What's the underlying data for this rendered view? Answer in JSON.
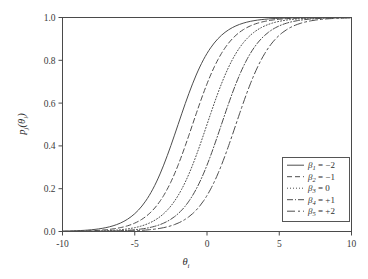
{
  "chart_data": {
    "type": "line",
    "title": "",
    "xlabel": "θᵢ",
    "ylabel": "pⱼ(θᵢ)",
    "xlim": [
      -10,
      10
    ],
    "ylim": [
      0.0,
      1.0
    ],
    "grid": false,
    "legend_position": "bottom-right",
    "x_ticks": [
      "-10",
      "-5",
      "0",
      "5",
      "10"
    ],
    "x_tick_values": [
      -10,
      -5,
      0,
      5,
      10
    ],
    "y_ticks": [
      "0.0",
      "0.2",
      "0.4",
      "0.6",
      "0.8",
      "1.0"
    ],
    "y_tick_values": [
      0.0,
      0.2,
      0.4,
      0.6,
      0.8,
      1.0
    ],
    "model": "logistic item characteristic curve",
    "discrimination": 0.8,
    "series": [
      {
        "name": "β₁ = −2",
        "beta_symbol": "β",
        "beta_index": "1",
        "beta_value": -2,
        "beta_label": "= −2",
        "linestyle": "solid",
        "dasharray": "",
        "x": [
          -10,
          -9,
          -8,
          -7,
          -6,
          -5,
          -4,
          -3,
          -2,
          -1,
          0,
          1,
          2,
          3,
          4,
          5,
          6,
          7,
          8,
          9,
          10
        ],
        "values": [
          0.0013,
          0.0029,
          0.0065,
          0.0144,
          0.0317,
          0.0687,
          0.1419,
          0.2689,
          0.4502,
          0.6457,
          0.8022,
          0.9002,
          0.9526,
          0.9781,
          0.99,
          0.9955,
          0.998,
          0.9991,
          0.9996,
          0.9998,
          0.9999
        ]
      },
      {
        "name": "β₂ = −1",
        "beta_symbol": "β",
        "beta_index": "2",
        "beta_value": -1,
        "beta_label": "= −1",
        "linestyle": "dashed",
        "dasharray": "5,3",
        "x": [
          -10,
          -9,
          -8,
          -7,
          -6,
          -5,
          -4,
          -3,
          -2,
          -1,
          0,
          1,
          2,
          3,
          4,
          5,
          6,
          7,
          8,
          9,
          10
        ],
        "values": [
          0.0006,
          0.0013,
          0.0029,
          0.0065,
          0.0144,
          0.0317,
          0.0687,
          0.1419,
          0.2689,
          0.4502,
          0.6457,
          0.8022,
          0.9002,
          0.9526,
          0.9781,
          0.99,
          0.9955,
          0.998,
          0.9991,
          0.9996,
          0.9998
        ]
      },
      {
        "name": "β₃ = 0",
        "beta_symbol": "β",
        "beta_index": "3",
        "beta_value": 0,
        "beta_label": "= 0",
        "linestyle": "dotted",
        "dasharray": "1,2",
        "x": [
          -10,
          -9,
          -8,
          -7,
          -6,
          -5,
          -4,
          -3,
          -2,
          -1,
          0,
          1,
          2,
          3,
          4,
          5,
          6,
          7,
          8,
          9,
          10
        ],
        "values": [
          0.0003,
          0.0006,
          0.0013,
          0.0029,
          0.0065,
          0.0144,
          0.0317,
          0.0687,
          0.1419,
          0.2689,
          0.4502,
          0.6457,
          0.8022,
          0.9002,
          0.9526,
          0.9781,
          0.99,
          0.9955,
          0.998,
          0.9991,
          0.9996
        ]
      },
      {
        "name": "β₄ = +1",
        "beta_symbol": "β",
        "beta_index": "4",
        "beta_value": 1,
        "beta_label": "= +1",
        "linestyle": "dashdot",
        "dasharray": "6,2,1,2",
        "x": [
          -10,
          -9,
          -8,
          -7,
          -6,
          -5,
          -4,
          -3,
          -2,
          -1,
          0,
          1,
          2,
          3,
          4,
          5,
          6,
          7,
          8,
          9,
          10
        ],
        "values": [
          0.0001,
          0.0003,
          0.0006,
          0.0013,
          0.0029,
          0.0065,
          0.0144,
          0.0317,
          0.0687,
          0.1419,
          0.2689,
          0.4502,
          0.6457,
          0.8022,
          0.9002,
          0.9526,
          0.9781,
          0.99,
          0.9955,
          0.998,
          0.9991
        ]
      },
      {
        "name": "β₅ = +2",
        "beta_symbol": "β",
        "beta_index": "5",
        "beta_value": 2,
        "beta_label": "= +2",
        "linestyle": "longdash",
        "dasharray": "8,3,2,3",
        "x": [
          -10,
          -9,
          -8,
          -7,
          -6,
          -5,
          -4,
          -3,
          -2,
          -1,
          0,
          1,
          2,
          3,
          4,
          5,
          6,
          7,
          8,
          9,
          10
        ],
        "values": [
          5e-05,
          0.0001,
          0.0003,
          0.0006,
          0.0013,
          0.0029,
          0.0065,
          0.0144,
          0.0317,
          0.0687,
          0.1419,
          0.2689,
          0.4502,
          0.6457,
          0.8022,
          0.9002,
          0.9526,
          0.9781,
          0.99,
          0.9955,
          0.998
        ]
      }
    ]
  },
  "axes": {
    "x_title_base": "θ",
    "x_title_sub": "i",
    "y_title_p": "p",
    "y_title_p_sub": "j",
    "y_title_theta": "(θ",
    "y_title_theta_sub": "i",
    "y_title_close": ")"
  },
  "colors": {
    "background": "#ffffff",
    "axis": "#4a4a4a",
    "curve": "#4d4d4d",
    "text": "#2e2e2e",
    "legend_border": "#555555"
  }
}
